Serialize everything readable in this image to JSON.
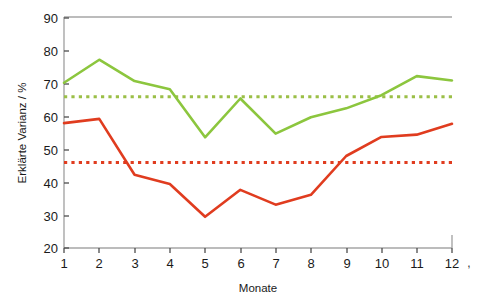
{
  "chart_data": {
    "type": "line",
    "title": "",
    "xlabel": "Monate",
    "ylabel": "Erklärte Varianz / %",
    "x": [
      1,
      2,
      3,
      4,
      5,
      6,
      7,
      8,
      9,
      10,
      11,
      12
    ],
    "xtick_labels": [
      "1",
      "2",
      "3",
      "4",
      "5",
      "6",
      "7",
      "8",
      "9",
      "10",
      "11",
      "12"
    ],
    "ytick_labels": [
      "20",
      "30",
      "40",
      "50",
      "60",
      "70",
      "80",
      "90"
    ],
    "yticks": [
      20,
      30,
      40,
      50,
      60,
      70,
      80,
      90
    ],
    "xlim": [
      1,
      12
    ],
    "ylim": [
      20,
      90
    ],
    "grid": false,
    "legend": "none",
    "series": [
      {
        "name": "green-series",
        "color": "#8CC63E",
        "style": "solid",
        "values": [
          70.3,
          77.3,
          70.8,
          68.3,
          53.7,
          65.5,
          54.8,
          59.8,
          62.5,
          66.5,
          72.3,
          71.0
        ]
      },
      {
        "name": "red-series",
        "color": "#E03C1F",
        "style": "solid",
        "values": [
          58.0,
          59.3,
          42.3,
          39.5,
          29.5,
          37.7,
          33.2,
          36.2,
          48.0,
          53.8,
          54.5,
          57.8
        ]
      }
    ],
    "reference_lines": [
      {
        "name": "green-mean-line",
        "color": "#9BBF47",
        "style": "dotted",
        "value": 66.0
      },
      {
        "name": "red-mean-line",
        "color": "#E03C1F",
        "style": "dotted",
        "value": 46.0
      }
    ],
    "annotations": [
      {
        "name": "corner-mark",
        "text": ","
      }
    ]
  },
  "axes": {
    "y_axis_title": "Erklärte Varianz / %",
    "x_axis_title": "Monate"
  }
}
